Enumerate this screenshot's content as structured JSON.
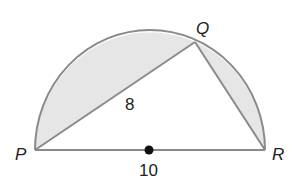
{
  "diagram": {
    "type": "semicircle-inscribed-triangle",
    "points": {
      "P": {
        "label": "P"
      },
      "Q": {
        "label": "Q"
      },
      "R": {
        "label": "R"
      }
    },
    "segment_labels": {
      "PQ": "8",
      "PR": "10"
    },
    "center_marker": "center point of diameter PR",
    "shaded_regions": [
      "segment between arc PQ and chord PQ",
      "segment between arc QR and chord QR"
    ],
    "colors": {
      "stroke": "#8a8a8a",
      "fill": "#e6e6e6",
      "center_dot": "#111111"
    }
  }
}
